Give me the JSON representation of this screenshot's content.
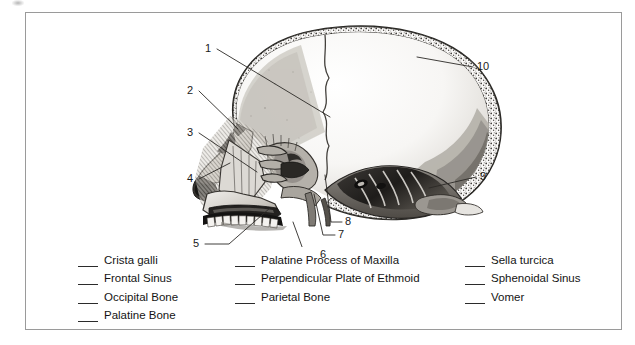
{
  "figure": {
    "callouts": [
      {
        "number": "1",
        "x": 180,
        "y": 31,
        "line": [
          [
            192,
            37
          ],
          [
            305,
            105
          ]
        ]
      },
      {
        "number": "2",
        "x": 162,
        "y": 73,
        "line": [
          [
            174,
            79
          ],
          [
            213,
            117
          ]
        ]
      },
      {
        "number": "3",
        "x": 162,
        "y": 115,
        "line": [
          [
            174,
            121
          ],
          [
            232,
            160
          ]
        ]
      },
      {
        "number": "4",
        "x": 162,
        "y": 161,
        "line": [
          [
            174,
            167
          ],
          [
            205,
            151
          ]
        ]
      },
      {
        "number": "5",
        "x": 168,
        "y": 226,
        "line": [
          [
            180,
            232
          ],
          [
            245,
            196
          ]
        ]
      },
      {
        "number": "6",
        "x": 295,
        "y": 239,
        "line": [
          [
            292,
            243
          ],
          [
            268,
            210
          ]
        ]
      },
      {
        "number": "7",
        "x": 313,
        "y": 219,
        "line": [
          [
            310,
            223
          ],
          [
            289,
            182
          ]
        ]
      },
      {
        "number": "8",
        "x": 320,
        "y": 206,
        "line": [
          [
            317,
            210
          ],
          [
            300,
            163
          ]
        ]
      },
      {
        "number": "10",
        "x": 452,
        "y": 49,
        "line": [
          [
            448,
            55
          ],
          [
            392,
            45
          ]
        ]
      },
      {
        "number": "9",
        "x": 455,
        "y": 159,
        "line": [
          [
            451,
            165
          ],
          [
            404,
            176
          ]
        ]
      }
    ]
  },
  "answer_list": {
    "columns": [
      {
        "name": "column-left",
        "items": [
          "Crista galli",
          "Frontal Sinus",
          "Occipital Bone",
          "Palatine Bone"
        ]
      },
      {
        "name": "column-middle",
        "items": [
          "Palatine Process of Maxilla",
          "Perpendicular Plate of Ethmoid",
          "Parietal Bone"
        ]
      },
      {
        "name": "column-right",
        "items": [
          "Sella turcica",
          "Sphenoidal Sinus",
          "Vomer"
        ]
      }
    ]
  },
  "colors": {
    "frame_border": "#9a9a9a",
    "ink": "#141414",
    "bone_light": "#e8e6e2",
    "bone_mid": "#b9b5ae",
    "bone_dark": "#6f6b65",
    "shadow": "#2e2c29"
  }
}
